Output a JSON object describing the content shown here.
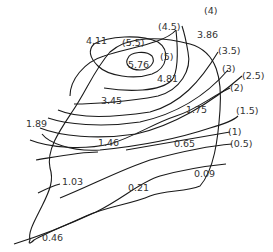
{
  "diagram": {
    "type": "contour-map",
    "colors": {
      "line": "#1a1a1a",
      "text": "#333333",
      "background": "#ffffff"
    },
    "contour_labels": [
      "(5.5)",
      "(5)",
      "(4.5)",
      "(4)",
      "(3.5)",
      "(3)",
      "(2.5)",
      "(2)",
      "(1.5)",
      "(1)",
      "(0.5)"
    ],
    "point_values": [
      "5.76",
      "4.81",
      "4.11",
      "3.86",
      "3.45",
      "1.89",
      "1.75",
      "1.46",
      "1.03",
      "0.65",
      "0.21",
      "0.09",
      "0.46"
    ],
    "labels": {
      "c55": "(5.5)",
      "c5": "(5)",
      "c45": "(4.5)",
      "c4": "(4)",
      "c35": "(3.5)",
      "c3": "(3)",
      "c25": "(2.5)",
      "c2": "(2)",
      "c15": "(1.5)",
      "c1": "(1)",
      "c05": "(0.5)",
      "v576": "5.76",
      "v481": "4.81",
      "v411": "4.11",
      "v386": "3.86",
      "v345": "3.45",
      "v189": "1.89",
      "v175": "1.75",
      "v146": "1.46",
      "v103": "1.03",
      "v065": "0.65",
      "v021": "0.21",
      "v009": "0.09",
      "v046": "0.46"
    }
  }
}
